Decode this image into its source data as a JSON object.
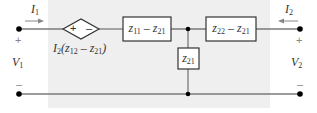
{
  "diagram": {
    "type": "circuit",
    "title": "",
    "colors": {
      "background": "#ffffff",
      "shaded_region": "#efefef",
      "wire": "#7a7a7a",
      "node": "#000000",
      "box_border": "#333333",
      "text": "#333333"
    },
    "terminals": {
      "left": {
        "current_label": "I",
        "current_sub": "1",
        "voltage_label": "V",
        "voltage_sub": "1",
        "plus": "+",
        "minus": "–"
      },
      "right": {
        "current_label": "I",
        "current_sub": "2",
        "voltage_label": "V",
        "voltage_sub": "2",
        "plus": "+",
        "minus": "–"
      }
    },
    "dependent_source": {
      "plus": "+",
      "minus": "–",
      "label_prefix": "I",
      "label_prefix_sub": "2",
      "label_expr": "(z",
      "label_sub_a": "12",
      "label_mid": " – z",
      "label_sub_b": "21",
      "label_end": ")"
    },
    "elements": [
      {
        "id": "series-left",
        "var": "z",
        "sub_a": "11",
        "op": " – z",
        "sub_b": "21"
      },
      {
        "id": "shunt",
        "var": "z",
        "sub_a": "21"
      },
      {
        "id": "series-right",
        "var": "z",
        "sub_a": "22",
        "op": " – z",
        "sub_b": "21"
      }
    ]
  }
}
